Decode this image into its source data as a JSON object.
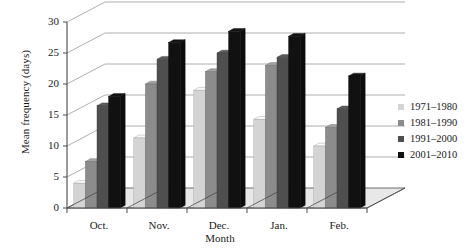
{
  "chart_data": {
    "type": "bar",
    "title": "",
    "xlabel": "Month",
    "ylabel": "Mean frequency (days)",
    "categories": [
      "Oct.",
      "Nov.",
      "Dec.",
      "Jan.",
      "Feb."
    ],
    "ylim": [
      0,
      30
    ],
    "yticks": [
      0,
      5,
      10,
      15,
      20,
      25,
      30
    ],
    "grid": true,
    "legend_position": "right",
    "style": "3d-perspective-column",
    "series": [
      {
        "name": "1971–1980",
        "color": "#d4d4d4",
        "values": [
          4,
          11.3,
          19,
          14.3,
          10
        ]
      },
      {
        "name": "1981–1990",
        "color": "#8c8c8c",
        "values": [
          7.5,
          20,
          22,
          23,
          13
        ]
      },
      {
        "name": "1991–2000",
        "color": "#4f4f4f",
        "values": [
          16.5,
          24,
          25,
          24.3,
          16
        ]
      },
      {
        "name": "2001–2010",
        "color": "#111111",
        "values": [
          18,
          26.7,
          28.5,
          27.7,
          21.3
        ]
      }
    ]
  },
  "axes": {
    "y_tick_labels": [
      "0",
      "5",
      "10",
      "15",
      "20",
      "25",
      "30"
    ],
    "x_tick_labels": [
      "Oct.",
      "Nov.",
      "Dec.",
      "Jan.",
      "Feb."
    ],
    "y_title": "Mean frequency (days)",
    "x_title": "Month"
  },
  "legend": {
    "items": [
      {
        "label": "1971–1980",
        "color": "#d4d4d4"
      },
      {
        "label": "1981–1990",
        "color": "#8c8c8c"
      },
      {
        "label": "1991–2000",
        "color": "#4f4f4f"
      },
      {
        "label": "2001–2010",
        "color": "#111111"
      }
    ]
  },
  "colors": {
    "axis": "#4a4a4a",
    "gridline": "#9a9a9a",
    "floor": "#e8e8e8",
    "text": "#1a1a1a"
  }
}
